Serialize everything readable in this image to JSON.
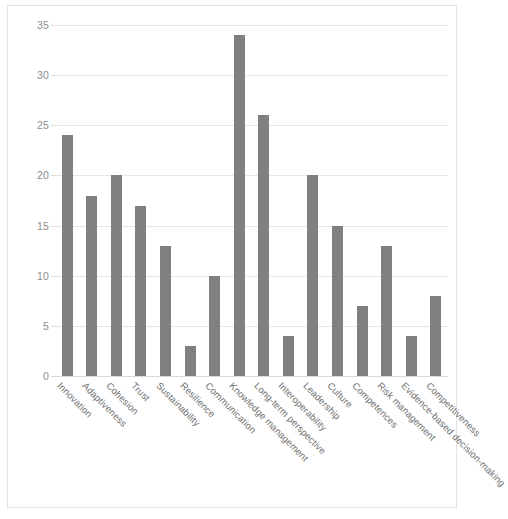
{
  "chart_data": {
    "type": "bar",
    "title": "",
    "subtitle": "",
    "xlabel": "",
    "ylabel": "",
    "ylim": [
      0,
      35
    ],
    "yticks": [
      0,
      5,
      10,
      15,
      20,
      25,
      30,
      35
    ],
    "ytick_labels": [
      "0",
      "5",
      "10",
      "15",
      "20",
      "25",
      "30",
      "35"
    ],
    "grid": true,
    "legend": false,
    "legend_position": "none",
    "orientation": "vertical",
    "bar_color": "#808080",
    "gridline_color": "#e6e6e6",
    "axis_text_color": "#8d8d8d",
    "label_text_color": "#6f6f6f",
    "plot_background": "#ffffff",
    "frame_border_color": "#e2e2e2",
    "xtick_rotation_deg": 45,
    "categories": [
      "Innovation",
      "Adaptiveness",
      "Cohesion",
      "Trust",
      "Sustainability",
      "Resilience",
      "Communication",
      "Knowledge management",
      "Long-term perspective",
      "Interoperability",
      "Leadership",
      "Culture",
      "Competences",
      "Risk management",
      "Evidence-based decision-making",
      "Competitiveness"
    ],
    "values": [
      24,
      18,
      20,
      17,
      13,
      3,
      10,
      34,
      26,
      4,
      20,
      15,
      7,
      13,
      4,
      8
    ]
  }
}
